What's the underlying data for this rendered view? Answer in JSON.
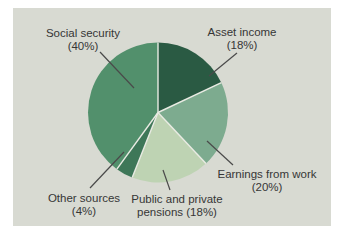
{
  "colors": {
    "panel_bg": "#d8dad2",
    "separator": "#e9ebe3",
    "leader_line": "#4a4a4a",
    "label_text": "#363636"
  },
  "chart_data": {
    "type": "pie",
    "title": "",
    "unit": "percent",
    "total": 100,
    "start_angle": "12 o'clock, clockwise",
    "legend_position": "none",
    "slices": [
      {
        "id": "asset-income",
        "label": "Asset income",
        "value": 18,
        "color": "#2a5a43",
        "label_lines": [
          "Asset income",
          "(18%)"
        ]
      },
      {
        "id": "earnings-from-work",
        "label": "Earnings from work",
        "value": 20,
        "color": "#7dab8f",
        "label_lines": [
          "Earnings from work",
          "(20%)"
        ]
      },
      {
        "id": "public-and-private-pensions",
        "label": "Public and private pensions",
        "value": 18,
        "color": "#bed3b3",
        "label_lines": [
          "Public and private",
          "pensions (18%)"
        ]
      },
      {
        "id": "other-sources",
        "label": "Other sources",
        "value": 4,
        "color": "#3e7758",
        "label_lines": [
          "Other sources",
          "(4%)"
        ]
      },
      {
        "id": "social-security",
        "label": "Social security",
        "value": 40,
        "color": "#52906c",
        "label_lines": [
          "Social security",
          "(40%)"
        ]
      }
    ]
  }
}
